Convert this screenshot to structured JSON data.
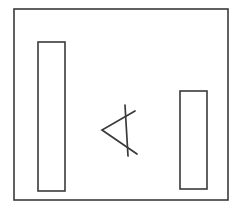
{
  "figure": {
    "background_color": "#ffffff",
    "stroke_color": "#3a3a3a",
    "canvas": {
      "width": 239,
      "height": 215
    },
    "frame": {
      "label": "outer frame",
      "x": 14,
      "y": 9,
      "width": 214,
      "height": 191,
      "stroke_width": 1.6
    },
    "shapes": [
      {
        "name": "left-bar",
        "label": "Left vertical bar",
        "type": "rectangle",
        "x": 38,
        "y": 42,
        "width": 27,
        "height": 149,
        "stroke_width": 1.6
      },
      {
        "name": "right-bar",
        "label": "Right vertical bar",
        "type": "rectangle",
        "x": 180,
        "y": 91,
        "width": 27,
        "height": 98,
        "stroke_width": 1.6
      }
    ],
    "glyph": {
      "name": "arrowhead-glyph",
      "label": "Arrowhead with vertical stroke",
      "type": "polyline-group",
      "stroke_width": 1.7,
      "strokes": [
        {
          "name": "arrowhead-chevron",
          "label": "less-than chevron",
          "points": "135,111 102,130 137,154"
        },
        {
          "name": "vertical-stroke",
          "label": "vertical stroke through chevron",
          "points": "125,105 128,156"
        }
      ]
    }
  }
}
